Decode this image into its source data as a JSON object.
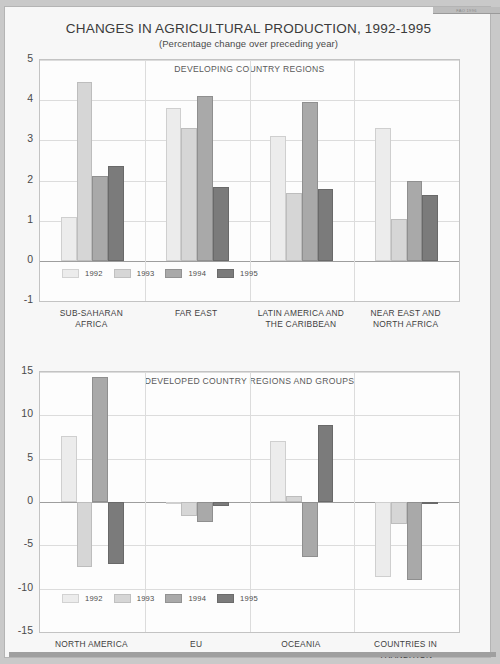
{
  "document": {
    "title": "CHANGES IN AGRICULTURAL PRODUCTION, 1992-1995",
    "subtitle": "(Percentage change over preceding year)",
    "corner_note": "FAO 1996"
  },
  "legend": {
    "entries": [
      {
        "label": "1992",
        "color": "#ececec"
      },
      {
        "label": "1993",
        "color": "#d6d6d6"
      },
      {
        "label": "1994",
        "color": "#a9a9a9"
      },
      {
        "label": "1995",
        "color": "#7b7b7b"
      }
    ]
  },
  "chart_data": [
    {
      "type": "bar",
      "title": "DEVELOPING COUNTRY REGIONS",
      "xlabel": "",
      "ylabel": "",
      "ylim": [
        -1,
        5
      ],
      "yticks": [
        5,
        4,
        3,
        2,
        1,
        0,
        -1
      ],
      "grid": true,
      "legend_position": "inside-bottom",
      "categories": [
        "SUB-SAHARAN AFRICA",
        "FAR EAST",
        "LATIN AMERICA AND THE CARIBBEAN",
        "NEAR EAST AND NORTH AFRICA"
      ],
      "series": [
        {
          "name": "1992",
          "values": [
            1.1,
            3.8,
            3.1,
            3.3
          ]
        },
        {
          "name": "1993",
          "values": [
            4.45,
            3.3,
            1.7,
            1.05
          ]
        },
        {
          "name": "1994",
          "values": [
            2.1,
            4.1,
            3.95,
            2.0
          ]
        },
        {
          "name": "1995",
          "values": [
            2.35,
            1.85,
            1.8,
            1.65
          ]
        }
      ]
    },
    {
      "type": "bar",
      "title": "DEVELOPED COUNTRY REGIONS AND GROUPS",
      "xlabel": "",
      "ylabel": "",
      "ylim": [
        -15,
        15
      ],
      "yticks": [
        15,
        10,
        5,
        0,
        -5,
        -10,
        -15
      ],
      "grid": true,
      "legend_position": "inside-bottom",
      "categories": [
        "NORTH AMERICA",
        "EU",
        "OCEANIA",
        "COUNTRIES IN TRANSITION"
      ],
      "series": [
        {
          "name": "1992",
          "values": [
            7.6,
            -0.1,
            7.0,
            -8.7
          ]
        },
        {
          "name": "1993",
          "values": [
            -7.5,
            -1.6,
            0.7,
            -2.5
          ]
        },
        {
          "name": "1994",
          "values": [
            14.4,
            -2.3,
            -6.3,
            -9.0
          ]
        },
        {
          "name": "1995",
          "values": [
            -7.2,
            -0.5,
            8.9,
            -0.15
          ]
        }
      ]
    }
  ],
  "charts": {
    "top": {
      "panel_title": "DEVELOPING COUNTRY REGIONS",
      "yticks": [
        "5",
        "4",
        "3",
        "2",
        "1",
        "0",
        "-1"
      ],
      "categories": [
        {
          "line1": "SUB-SAHARAN",
          "line2": "AFRICA"
        },
        {
          "line1": "FAR EAST",
          "line2": ""
        },
        {
          "line1": "LATIN AMERICA AND",
          "line2": "THE CARIBBEAN"
        },
        {
          "line1": "NEAR EAST AND",
          "line2": "NORTH AFRICA"
        }
      ]
    },
    "bottom": {
      "panel_title": "DEVELOPED COUNTRY REGIONS AND GROUPS",
      "yticks": [
        "15",
        "10",
        "5",
        "0",
        "-5",
        "-10",
        "-15"
      ],
      "categories": [
        {
          "line1": "NORTH AMERICA",
          "line2": ""
        },
        {
          "line1": "EU",
          "line2": ""
        },
        {
          "line1": "OCEANIA",
          "line2": ""
        },
        {
          "line1": "COUNTRIES IN",
          "line2": "TRANSITION"
        }
      ]
    }
  }
}
